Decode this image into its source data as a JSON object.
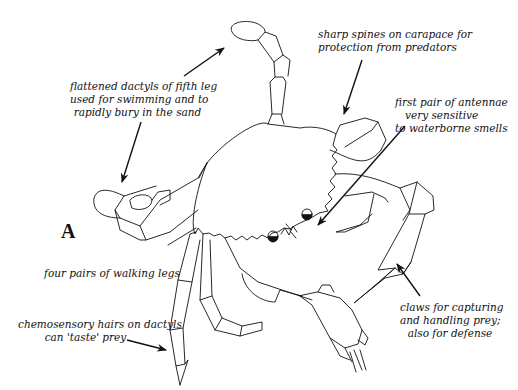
{
  "figure": {
    "letter": "A"
  },
  "annotations": {
    "fifth_leg": {
      "lines": [
        "flattened dactyls of fifth leg",
        "used for swimming and to",
        "rapidly bury in the sand"
      ]
    },
    "spines": {
      "lines": [
        "sharp spines on carapace for",
        "protection from predators"
      ]
    },
    "antennae": {
      "lines": [
        "first pair of antennae",
        "very sensitive",
        "to waterborne smells"
      ]
    },
    "walking_legs": {
      "lines": [
        "four pairs of walking legs"
      ]
    },
    "chemosensory": {
      "lines": [
        "chemosensory hairs on dactyls",
        "can 'taste' prey"
      ]
    },
    "claws": {
      "lines": [
        "claws for capturing",
        "and handling prey;",
        "also for defense"
      ]
    }
  },
  "colors": {
    "ink": "#111111",
    "background": "#ffffff"
  }
}
